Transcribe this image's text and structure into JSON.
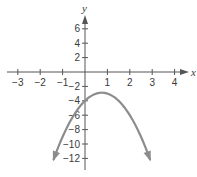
{
  "chart_data": {
    "type": "line",
    "title": "",
    "xlabel": "x",
    "ylabel": "y",
    "xlim": [
      -3.4,
      4.6
    ],
    "ylim": [
      -13.5,
      8.5
    ],
    "grid": false,
    "x_ticks": [
      -3,
      -2,
      -1,
      1,
      2,
      3,
      4
    ],
    "x_tick_labels": [
      "−3",
      "−2",
      "−1",
      "1",
      "2",
      "3",
      "4"
    ],
    "y_ticks": [
      6,
      4,
      2,
      -2,
      -4,
      -6,
      -8,
      -10,
      -12
    ],
    "y_tick_labels": [
      "6",
      "4",
      "2",
      "−2",
      "−4",
      "−6",
      "−8",
      "−10",
      "−12"
    ],
    "series": [
      {
        "name": "parabola",
        "equation": "y = -2x^2 + 3x - 4",
        "color": "#8c8c8c",
        "vertex": [
          0.75,
          -2.875
        ],
        "y_intercept": -4,
        "arrows_at_ends": true,
        "x": [
          -1.4,
          -1.0,
          -0.5,
          0.0,
          0.5,
          0.75,
          1.0,
          1.5,
          2.0,
          2.5,
          2.9
        ],
        "y": [
          -12.12,
          -9.0,
          -6.0,
          -4.0,
          -3.0,
          -2.875,
          -3.0,
          -4.0,
          -6.0,
          -9.0,
          -12.12
        ]
      }
    ]
  },
  "colors": {
    "axis": "#555555",
    "curve": "#8c8c8c",
    "text": "#3a3a3a"
  }
}
